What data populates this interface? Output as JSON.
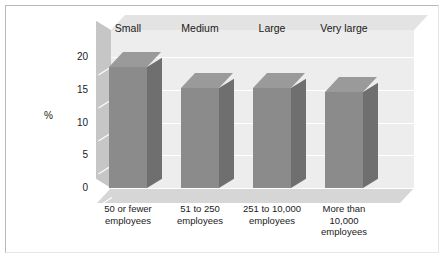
{
  "chart_data": {
    "type": "bar",
    "title": "",
    "subtitle": "",
    "xlabel": "",
    "ylabel": "%",
    "ylim": [
      0,
      20
    ],
    "yticks": [
      0,
      5,
      10,
      15,
      20
    ],
    "ytick_labels": [
      "0",
      "5",
      "10",
      "15",
      "20"
    ],
    "grid": true,
    "legend": "none",
    "three_d": true,
    "categories": [
      "50 or fewer employees",
      "51 to 250 employees",
      "251 to 10,000 employees",
      "More than 10,000 employees"
    ],
    "category_lines": [
      [
        "50 or fewer",
        "employees"
      ],
      [
        "51 to 250",
        "employees"
      ],
      [
        "251 to 10,000",
        "employees"
      ],
      [
        "More than",
        "10,000",
        "employees"
      ]
    ],
    "group_labels": [
      "Small",
      "Medium",
      "Large",
      "Very large"
    ],
    "values": [
      18.5,
      15.3,
      15.3,
      14.7
    ],
    "series": [
      {
        "name": "Percent",
        "values": [
          18.5,
          15.3,
          15.3,
          14.7
        ]
      }
    ],
    "colors": {
      "bar_front": "#8b8b8b",
      "bar_side": "#6f6f6f",
      "bar_top": "#9a9a9a",
      "back_wall": "#ededed",
      "left_wall": "#c6c6c6",
      "floor": "#d6d6d6",
      "gridline": "#ffffff",
      "text": "#1a1a1a",
      "frame": "#b8b8b8",
      "background": "#ffffff"
    }
  }
}
